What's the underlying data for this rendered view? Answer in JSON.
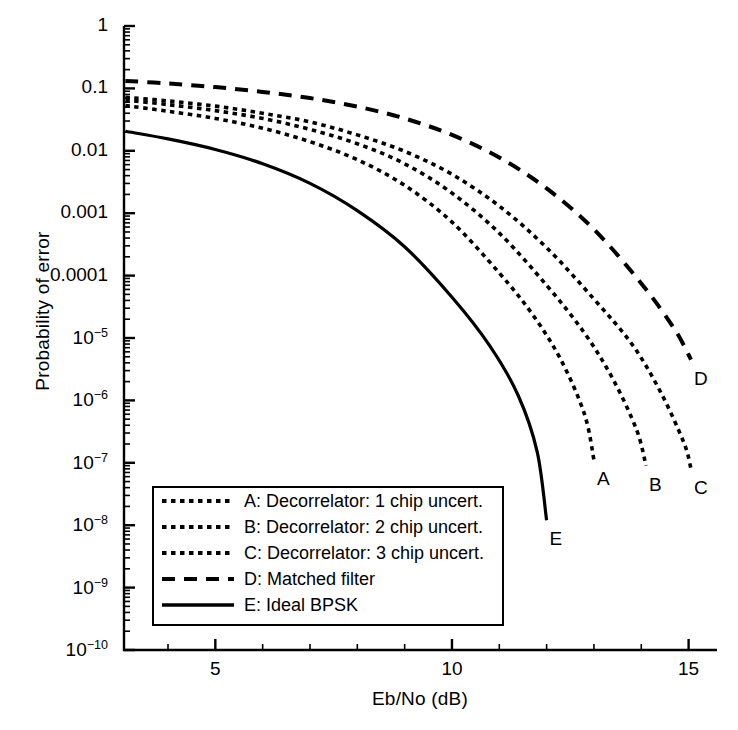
{
  "chart_data": {
    "type": "line",
    "title": "",
    "xlabel": "Eb/No (dB)",
    "ylabel": "Probability of error",
    "xlim": [
      3.07,
      15.6
    ],
    "ylim": [
      1e-10,
      1
    ],
    "yscale": "log",
    "grid": false,
    "legend_position": "lower-left-inside",
    "xticks": [
      5,
      10,
      15
    ],
    "xtick_labels": [
      "5",
      "10",
      "15"
    ],
    "yticks": [
      1,
      0.1,
      0.01,
      0.001,
      0.0001,
      1e-05,
      1e-06,
      1e-07,
      1e-08,
      1e-09,
      1e-10
    ],
    "ytick_labels": [
      "1",
      "0.1",
      "0.01",
      "0.001",
      "0.0001",
      "10-5",
      "10-6",
      "10-7",
      "10-8",
      "10-9",
      "10-10"
    ],
    "series": [
      {
        "name": "A: Decorrelator: 1 chip uncert.",
        "key": "A",
        "style": "dotted",
        "end_label": "A",
        "x": [
          3.1,
          4.0,
          5.0,
          6.0,
          7.0,
          8.0,
          9.0,
          10.0,
          11.0,
          11.7,
          12.3,
          12.8,
          13.0
        ],
        "y": [
          0.053,
          0.043,
          0.033,
          0.023,
          0.014,
          0.0072,
          0.0028,
          0.00072,
          0.00011,
          2.4e-05,
          4.5e-06,
          6e-07,
          1.1e-07
        ]
      },
      {
        "name": "B: Decorrelator: 2 chip uncert.",
        "key": "B",
        "style": "dotted",
        "end_label": "B",
        "x": [
          3.1,
          4.0,
          5.0,
          6.0,
          7.0,
          8.0,
          9.0,
          10.0,
          11.0,
          12.0,
          12.8,
          13.4,
          13.9,
          14.1
        ],
        "y": [
          0.065,
          0.055,
          0.044,
          0.033,
          0.022,
          0.013,
          0.0062,
          0.0021,
          0.00048,
          7e-05,
          1.2e-05,
          2.2e-06,
          3.4e-07,
          9e-08
        ]
      },
      {
        "name": "C: Decorrelator: 3 chip uncert.",
        "key": "C",
        "style": "dotted",
        "end_label": "C",
        "x": [
          3.1,
          4.0,
          5.0,
          6.0,
          7.0,
          8.0,
          9.0,
          10.0,
          11.0,
          12.0,
          13.0,
          13.8,
          14.4,
          14.9,
          15.05
        ],
        "y": [
          0.072,
          0.063,
          0.052,
          0.04,
          0.029,
          0.018,
          0.0098,
          0.0042,
          0.0013,
          0.00028,
          4.2e-05,
          8e-06,
          1.4e-06,
          2.1e-07,
          8e-08
        ]
      },
      {
        "name": "D: Matched filter",
        "key": "D",
        "style": "dashed",
        "end_label": "D",
        "x": [
          3.1,
          4.0,
          5.0,
          6.0,
          7.0,
          8.0,
          9.0,
          10.0,
          11.0,
          12.0,
          13.0,
          14.0,
          14.7,
          15.05
        ],
        "y": [
          0.132,
          0.12,
          0.105,
          0.088,
          0.07,
          0.051,
          0.033,
          0.018,
          0.0078,
          0.0025,
          0.00055,
          7.5e-05,
          1.4e-05,
          4.5e-06
        ]
      },
      {
        "name": "E: Ideal BPSK",
        "key": "E",
        "style": "solid",
        "end_label": "E",
        "x": [
          3.1,
          4.0,
          5.0,
          6.0,
          7.0,
          8.0,
          9.0,
          10.0,
          10.8,
          11.4,
          11.8,
          12.0
        ],
        "y": [
          0.0205,
          0.0155,
          0.0105,
          0.0062,
          0.003,
          0.0011,
          0.00029,
          4.5e-05,
          7.5e-06,
          1.2e-06,
          1.5e-07,
          1.2e-08
        ]
      }
    ]
  },
  "legend": {
    "items": [
      {
        "sample": "dotted",
        "label": "A: Decorrelator: 1 chip uncert."
      },
      {
        "sample": "dotted",
        "label": "B: Decorrelator: 2 chip uncert."
      },
      {
        "sample": "dotted",
        "label": "C: Decorrelator: 3 chip uncert."
      },
      {
        "sample": "dashed",
        "label": "D: Matched filter"
      },
      {
        "sample": "solid",
        "label": "E: Ideal BPSK"
      }
    ]
  },
  "colors": {
    "ink": "#000000",
    "background": "#ffffff"
  }
}
